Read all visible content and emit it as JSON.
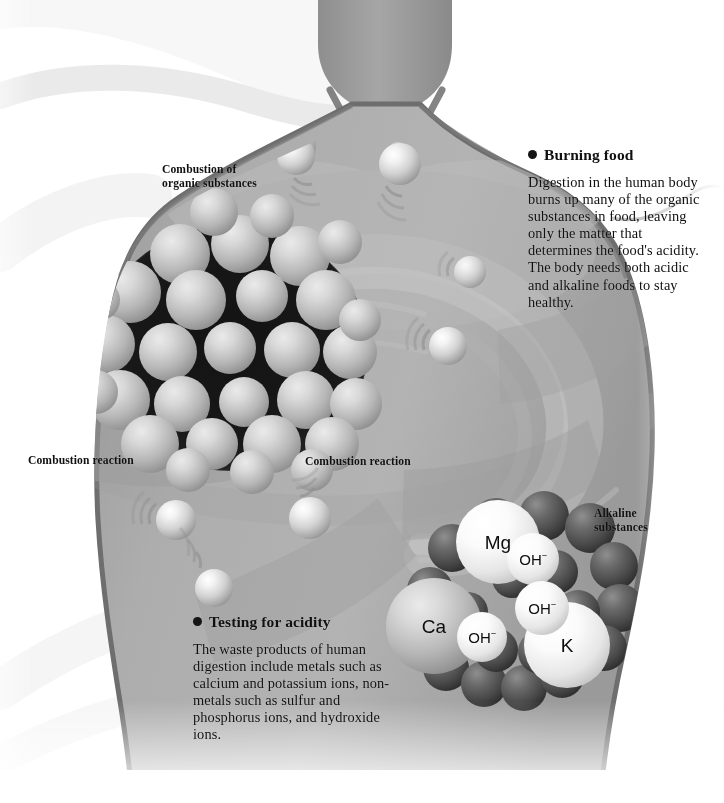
{
  "illustration": {
    "subject": "human-torso-digestion-acidity",
    "palette": {
      "background": "#ffffff",
      "body_fill": "#a8a8a8",
      "body_outline": "#6f6f6f",
      "cavity_dark": "#2a2a2a",
      "sphere_light": "#e9e9e9",
      "sphere_mid": "#b4b4b4",
      "sphere_dark": "#3a3a3a",
      "text": "#101010"
    }
  },
  "callouts": [
    {
      "id": "burning-food",
      "heading": "Burning food",
      "body": "Digestion in the human body burns up many of the organic substances in food, leaving only the matter that determines the food's acidity. The body needs both acidic and alkaline foods to stay healthy."
    },
    {
      "id": "testing-for-acidity",
      "heading": "Testing for acidity",
      "body": "The waste products of human digestion include metals such as calcium and potassium ions, non-metals such as sulfur and phosphorus ions, and hydroxide ions."
    }
  ],
  "captions": {
    "combustion_organic": "Combustion of\norganic substances",
    "combustion_reaction_left": "Combustion reaction",
    "combustion_reaction_right": "Combustion reaction",
    "alkaline_substances": "Alkaline\nsubstances"
  },
  "atoms": [
    {
      "id": "mg",
      "symbol": "Mg",
      "charge": ""
    },
    {
      "id": "ca",
      "symbol": "Ca",
      "charge": ""
    },
    {
      "id": "k",
      "symbol": "K",
      "charge": ""
    },
    {
      "id": "oh-1",
      "symbol": "OH",
      "charge": "−"
    },
    {
      "id": "oh-2",
      "symbol": "OH",
      "charge": "−"
    },
    {
      "id": "oh-3",
      "symbol": "OH",
      "charge": "−"
    }
  ]
}
